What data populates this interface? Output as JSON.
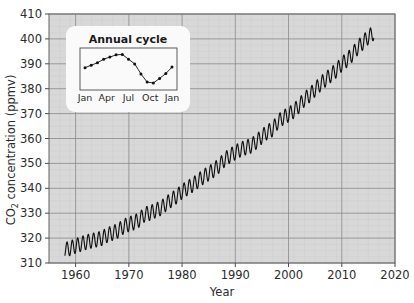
{
  "chart_data": {
    "type": "line",
    "title": "",
    "xlabel": "Year",
    "ylabel": "CO 2 concentration (ppmv)",
    "ylabel_main": "CO",
    "ylabel_sub": "2",
    "ylabel_rest": " concentration (ppmv)",
    "xlim": [
      1955,
      2020
    ],
    "ylim": [
      310,
      410
    ],
    "xticks": [
      1960,
      1970,
      1980,
      1990,
      2000,
      2010,
      2020
    ],
    "xtick_labels": [
      "1960",
      "1970",
      "1980",
      "1990",
      "2000",
      "2010",
      "2020"
    ],
    "yticks": [
      310,
      320,
      330,
      340,
      350,
      360,
      370,
      380,
      390,
      400,
      410
    ],
    "ytick_labels": [
      "310",
      "320",
      "330",
      "340",
      "350",
      "360",
      "370",
      "380",
      "390",
      "400",
      "410"
    ],
    "grid": true,
    "minor_grid": true,
    "plot_bg": "#d8d8d8",
    "grid_color": "#8e8e8e",
    "minor_grid_color": "#cfcfcf",
    "line_color": "#111111",
    "legend": "none",
    "series": [
      {
        "name": "Mauna Loa monthly mean CO2",
        "x": [
          1958,
          1959,
          1960,
          1961,
          1962,
          1963,
          1964,
          1965,
          1966,
          1967,
          1968,
          1969,
          1970,
          1971,
          1972,
          1973,
          1974,
          1975,
          1976,
          1977,
          1978,
          1979,
          1980,
          1981,
          1982,
          1983,
          1984,
          1985,
          1986,
          1987,
          1988,
          1989,
          1990,
          1991,
          1992,
          1993,
          1994,
          1995,
          1996,
          1997,
          1998,
          1999,
          2000,
          2001,
          2002,
          2003,
          2004,
          2005,
          2006,
          2007,
          2008,
          2009,
          2010,
          2011,
          2012,
          2013,
          2014,
          2015,
          2016
        ],
        "values": [
          315.3,
          315.9,
          316.9,
          317.6,
          318.4,
          318.9,
          319.4,
          320.0,
          321.3,
          322.1,
          323.0,
          324.6,
          325.6,
          326.3,
          327.4,
          329.6,
          330.1,
          331.1,
          332.0,
          333.8,
          335.4,
          336.8,
          338.7,
          340.1,
          341.4,
          343.0,
          344.6,
          346.0,
          347.4,
          349.2,
          351.6,
          353.1,
          354.4,
          355.6,
          356.4,
          357.1,
          358.8,
          360.8,
          362.6,
          363.7,
          366.7,
          368.4,
          369.6,
          371.1,
          373.2,
          375.8,
          377.5,
          379.8,
          381.9,
          383.8,
          385.6,
          387.4,
          389.9,
          391.6,
          393.8,
          396.5,
          398.6,
          400.8,
          402.4
        ]
      }
    ],
    "annual_amplitude_ppmv": 6.0,
    "inset": {
      "title": "Annual cycle",
      "xlabel": "",
      "ylabel": "",
      "type": "line",
      "xtick_labels": [
        "Jan",
        "Apr",
        "Jul",
        "Oct",
        "Jan"
      ],
      "categories": [
        "Jan",
        "Feb",
        "Mar",
        "Apr",
        "May",
        "Jun",
        "Jul",
        "Aug",
        "Sep",
        "Oct",
        "Nov",
        "Dec",
        "Jan"
      ],
      "values": [
        384.7,
        386.0,
        387.3,
        389.2,
        390.3,
        391.5,
        391.7,
        389.2,
        386.7,
        381.4,
        377.1,
        376.6,
        379.0,
        381.6,
        385.0
      ],
      "points_x": [
        "Jan",
        "Feb",
        "Mar",
        "Apr",
        "May",
        "Jun",
        "Jul",
        "Aug",
        "Sep",
        "Oct",
        "Nov",
        "Dec",
        "Jan2"
      ],
      "ylim": [
        375.0,
        393.0
      ],
      "grid": false,
      "panel_bg": "#fafafa",
      "marker": "circle",
      "marker_color": "#111111"
    }
  }
}
